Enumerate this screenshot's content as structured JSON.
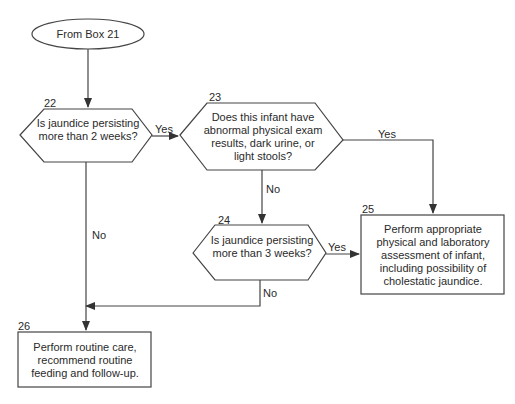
{
  "diagram": {
    "type": "flowchart",
    "start": {
      "label": "From Box 21"
    },
    "nodes": [
      {
        "id": "22",
        "number": "22",
        "shape": "hexagon",
        "text": "Is jaundice persisting more than 2 weeks?"
      },
      {
        "id": "23",
        "number": "23",
        "shape": "hexagon",
        "text": "Does this infant have abnormal physical exam results, dark urine, or light stools?"
      },
      {
        "id": "24",
        "number": "24",
        "shape": "hexagon",
        "text": "Is jaundice persisting more than 3 weeks?"
      },
      {
        "id": "25",
        "number": "25",
        "shape": "rectangle",
        "text": "Perform appropriate physical and laboratory assessment of infant, including possibility of cholestatic jaundice."
      },
      {
        "id": "26",
        "number": "26",
        "shape": "rectangle",
        "text": "Perform routine care, recommend routine feeding and follow-up."
      }
    ],
    "edges": [
      {
        "from": "start",
        "to": "22",
        "label": ""
      },
      {
        "from": "22",
        "to": "23",
        "label": "Yes"
      },
      {
        "from": "22",
        "to": "26",
        "label": "No"
      },
      {
        "from": "23",
        "to": "25",
        "label": "Yes"
      },
      {
        "from": "23",
        "to": "24",
        "label": "No"
      },
      {
        "from": "24",
        "to": "25",
        "label": "Yes"
      },
      {
        "from": "24",
        "to": "26",
        "label": "No"
      }
    ],
    "labels": {
      "yes": "Yes",
      "no": "No"
    },
    "colors": {
      "stroke": "#333333",
      "text": "#2a2a2a",
      "background": "#ffffff"
    }
  }
}
